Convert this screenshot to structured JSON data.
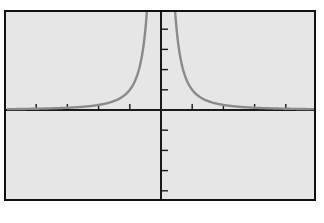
{
  "chart_data": {
    "type": "line",
    "title": "",
    "xlabel": "",
    "ylabel": "",
    "function": "y = 1/x^2",
    "x_ticks": [
      -4,
      -3,
      -2,
      -1,
      1,
      2,
      3,
      4
    ],
    "y_ticks": [
      -4,
      -3,
      -2,
      -1,
      1,
      2,
      3,
      4
    ],
    "xlim": [
      -5,
      5
    ],
    "ylim": [
      -4.5,
      5
    ],
    "grid": false,
    "legend": null,
    "series": [
      {
        "name": "y = 1/x^2",
        "color": "#8a8a8a",
        "x": [
          -5,
          -4,
          -3,
          -2,
          -1.5,
          -1,
          -0.75,
          -0.5,
          -0.45,
          0.45,
          0.5,
          0.75,
          1,
          1.5,
          2,
          3,
          4,
          5
        ],
        "y": [
          0.04,
          0.0625,
          0.111,
          0.25,
          0.444,
          1,
          1.778,
          4,
          4.94,
          4.94,
          4,
          1.778,
          1,
          0.444,
          0.25,
          0.111,
          0.0625,
          0.04
        ]
      }
    ]
  },
  "colors": {
    "background": "#e6e6e6",
    "frame": "#111111",
    "axes": "#1a1a1a",
    "curve": "#8a8a8a"
  }
}
